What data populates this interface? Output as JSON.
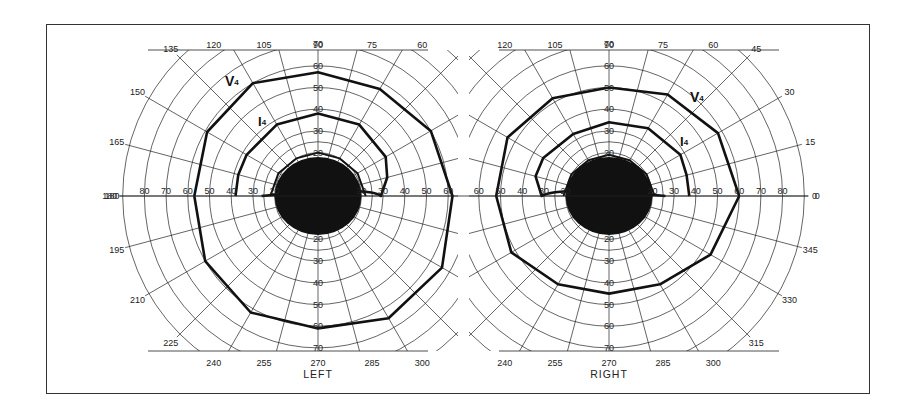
{
  "chart_data": {
    "type": "polar-isopter",
    "scale_deg_per_ring": 10,
    "ring_labels": [
      "20",
      "30",
      "40",
      "50",
      "60",
      "70"
    ],
    "axis_ring_labels_horizontal": [
      "80",
      "70",
      "60",
      "50",
      "40",
      "30",
      "20"
    ],
    "meridian_labels": [
      "0",
      "15",
      "30",
      "45",
      "60",
      "75",
      "90",
      "105",
      "120",
      "135",
      "150",
      "165",
      "180",
      "195",
      "210",
      "225",
      "240",
      "255",
      "270",
      "285",
      "300",
      "315",
      "330",
      "345"
    ],
    "panels": [
      {
        "name": "LEFT",
        "center_scotoma_radius_deg": 20,
        "visible_meridian_labels": [
          "120",
          "105",
          "90",
          "75",
          "60",
          "135",
          "150",
          "165",
          "180",
          "195",
          "210",
          "225",
          "240",
          "255",
          "270",
          "285",
          "300"
        ],
        "isopters": [
          {
            "name": "V4",
            "label": "V",
            "sub": "4",
            "points_deg": [
              [
                0,
                57
              ],
              [
                30,
                59
              ],
              [
                60,
                60
              ],
              [
                90,
                57
              ],
              [
                120,
                57
              ],
              [
                150,
                60
              ],
              [
                180,
                62
              ],
              [
                210,
                66
              ],
              [
                240,
                65
              ],
              [
                270,
                61
              ],
              [
                300,
                62
              ],
              [
                330,
                60
              ],
              [
                360,
                57
              ]
            ]
          },
          {
            "name": "I4",
            "label": "I",
            "sub": "4",
            "points_deg": [
              [
                0,
                38
              ],
              [
                15,
                38
              ],
              [
                30,
                38
              ],
              [
                60,
                38
              ],
              [
                90,
                38
              ],
              [
                120,
                38
              ],
              [
                150,
                36
              ],
              [
                165,
                33
              ],
              [
                180,
                29
              ]
            ]
          },
          {
            "name": "inner",
            "label": "",
            "points_deg": [
              [
                0,
                22
              ],
              [
                30,
                21
              ],
              [
                60,
                20
              ],
              [
                90,
                20
              ],
              [
                120,
                20
              ],
              [
                150,
                21
              ],
              [
                180,
                22
              ]
            ]
          }
        ]
      },
      {
        "name": "RIGHT",
        "center_scotoma_radius_deg": 20,
        "visible_meridian_labels": [
          "120",
          "105",
          "90",
          "75",
          "60",
          "45",
          "30",
          "15",
          "0",
          "345",
          "330",
          "315",
          "240",
          "255",
          "270",
          "285",
          "300"
        ],
        "isopters": [
          {
            "name": "V4",
            "label": "V",
            "sub": "4",
            "points_deg": [
              [
                0,
                60
              ],
              [
                30,
                58
              ],
              [
                60,
                54
              ],
              [
                90,
                50
              ],
              [
                120,
                52
              ],
              [
                150,
                54
              ],
              [
                180,
                52
              ],
              [
                210,
                52
              ],
              [
                240,
                47
              ],
              [
                270,
                45
              ],
              [
                300,
                47
              ],
              [
                330,
                54
              ],
              [
                360,
                60
              ]
            ]
          },
          {
            "name": "I4",
            "label": "I",
            "sub": "4",
            "points_deg": [
              [
                0,
                37
              ],
              [
                15,
                37
              ],
              [
                30,
                38
              ],
              [
                60,
                36
              ],
              [
                90,
                34
              ],
              [
                120,
                33
              ],
              [
                150,
                35
              ],
              [
                165,
                35
              ],
              [
                180,
                31
              ]
            ]
          },
          {
            "name": "inner",
            "label": "",
            "points_deg": [
              [
                0,
                21
              ],
              [
                30,
                20
              ],
              [
                60,
                19
              ],
              [
                90,
                19
              ],
              [
                120,
                19
              ],
              [
                150,
                20
              ],
              [
                180,
                21
              ]
            ]
          }
        ]
      }
    ]
  },
  "labels": {
    "left_title": "LEFT",
    "right_title": "RIGHT"
  }
}
